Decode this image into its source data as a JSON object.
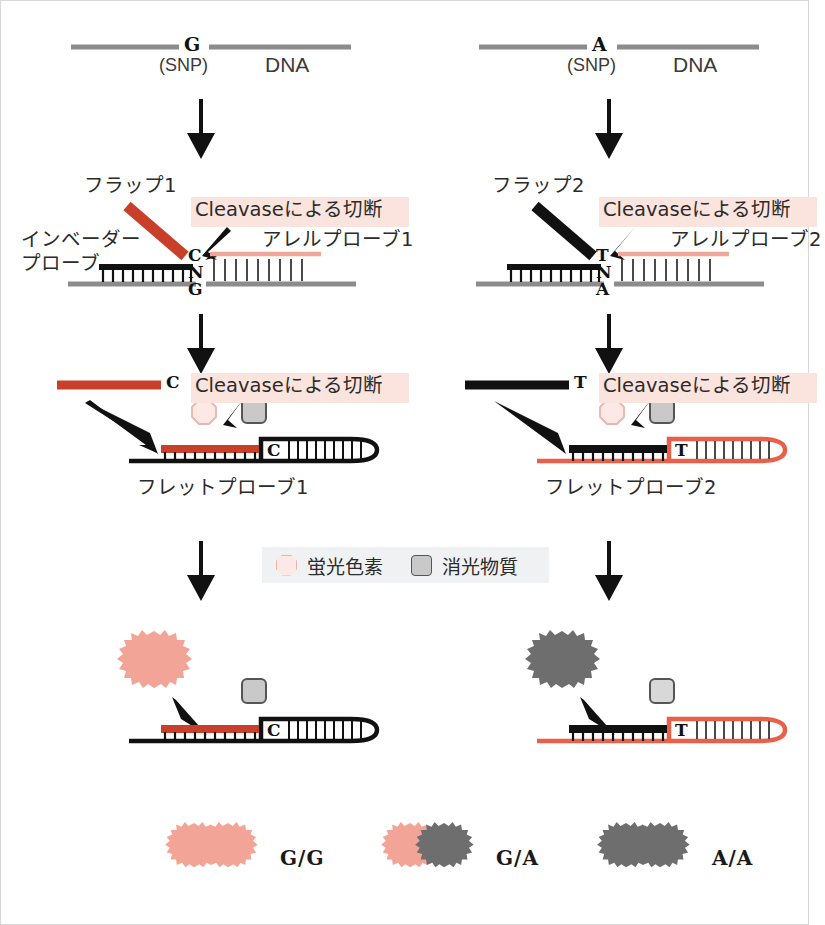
{
  "figure": {
    "title_implied": "Invader assay SNP genotyping schematic",
    "colors": {
      "flap1_red": "#C8402A",
      "flap2_black": "#111111",
      "allele_probe_pink": "#EFA899",
      "fret_probe2_salmon": "#E8604A",
      "dna_gray": "#8C8C8C",
      "highlight_pink": "#FBE4DE",
      "fluorophore_fill": "#F2A496",
      "fluorophore_pale": "#FCE9E6",
      "quencher_gray": "#6E6E6E",
      "quencher_pale": "#C9C9C9",
      "legend_bg": "#F0F1F3",
      "ink": "#111111"
    }
  },
  "columns": [
    {
      "id": "left",
      "allele": "G",
      "stage1": {
        "snp_base": "G",
        "snp_caption": "(SNP)",
        "dna_label": "DNA"
      },
      "stage2": {
        "flap_label": "フラップ1",
        "invader_label_line1": "インベーダー",
        "invader_label_line2": "プローブ",
        "cleavase_label": "Cleavaseによる切断",
        "allele_probe_label": "アレルプローブ1",
        "bases": [
          "C",
          "N",
          "G"
        ]
      },
      "stage3": {
        "cleaved_flap_base": "C",
        "cleavase_label": "Cleavaseによる切断",
        "fret_probe_label": "フレットプローブ1",
        "hairpin_base": "C"
      },
      "stage4": {
        "hairpin_base": "C",
        "released_signal": "fluorophore"
      }
    },
    {
      "id": "right",
      "allele": "A",
      "stage1": {
        "snp_base": "A",
        "snp_caption": "(SNP)",
        "dna_label": "DNA"
      },
      "stage2": {
        "flap_label": "フラップ2",
        "cleavase_label": "Cleavaseによる切断",
        "allele_probe_label": "アレルプローブ2",
        "bases": [
          "T",
          "N",
          "A"
        ]
      },
      "stage3": {
        "cleaved_flap_base": "T",
        "cleavase_label": "Cleavaseによる切断",
        "fret_probe_label": "フレットプローブ2",
        "hairpin_base": "T"
      },
      "stage4": {
        "hairpin_base": "T",
        "released_signal": "quencher"
      }
    }
  ],
  "legend": {
    "fluorophore_label": "蛍光色素",
    "quencher_label": "消光物質"
  },
  "results": [
    {
      "genotype": "G/G",
      "bursts": [
        "pink",
        "pink"
      ]
    },
    {
      "genotype": "G/A",
      "bursts": [
        "pink",
        "gray"
      ]
    },
    {
      "genotype": "A/A",
      "bursts": [
        "gray",
        "gray"
      ]
    }
  ]
}
